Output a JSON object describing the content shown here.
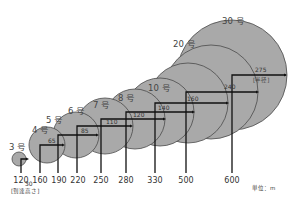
{
  "diagram": {
    "caption_left": "[到達高さ]",
    "caption_radius": "[半径]",
    "unit_label": "単位：m",
    "shells": [
      {
        "name": "3 号",
        "height": "120",
        "radius": "30"
      },
      {
        "name": "4 号",
        "height": "160",
        "radius": "65"
      },
      {
        "name": "5 号",
        "height": "190",
        "radius": "85"
      },
      {
        "name": "6 号",
        "height": "220",
        "radius": "110"
      },
      {
        "name": "7 号",
        "height": "250",
        "radius": "120"
      },
      {
        "name": "8 号",
        "height": "280",
        "radius": "140"
      },
      {
        "name": "10 号",
        "height": "330",
        "radius": "160"
      },
      {
        "name": "20 号",
        "height": "500",
        "radius": "240"
      },
      {
        "name": "30 号",
        "height": "600",
        "radius": "275"
      }
    ],
    "colors": {
      "circle_fill": "#a9a9a9",
      "circle_stroke": "#4a4a4a",
      "line": "#111111"
    }
  }
}
